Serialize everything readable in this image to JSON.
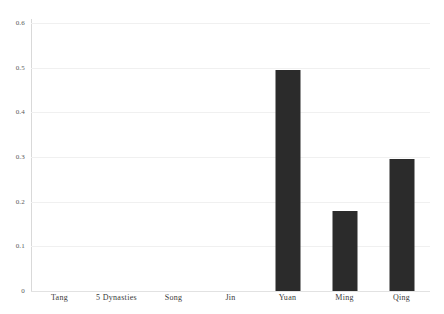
{
  "chart_data": {
    "type": "bar",
    "title": "",
    "subtitle": "",
    "xlabel": "",
    "ylabel": "",
    "categories": [
      "Tang",
      "5 Dynasties",
      "Song",
      "Jin",
      "Yuan",
      "Ming",
      "Qing"
    ],
    "values": [
      0,
      0,
      0,
      0,
      0.495,
      0.18,
      0.295
    ],
    "ylim": [
      0,
      0.6
    ],
    "xlim": null,
    "y_ticks": [
      0,
      0.1,
      0.2,
      0.3,
      0.4,
      0.5,
      0.6
    ],
    "y_tick_labels": [
      "0",
      "0.1",
      "0.2",
      "0.3",
      "0.4",
      "0.5",
      "0.6"
    ],
    "grid": "horizontal",
    "legend": null,
    "legend_position": "none",
    "annotations": [],
    "bar_color": "#2b2b2b",
    "gridline_color": "#f0f0f0",
    "axis_color": "#d9d9d9",
    "background_color": "#ffffff",
    "text_color": "#3a3a3a"
  }
}
